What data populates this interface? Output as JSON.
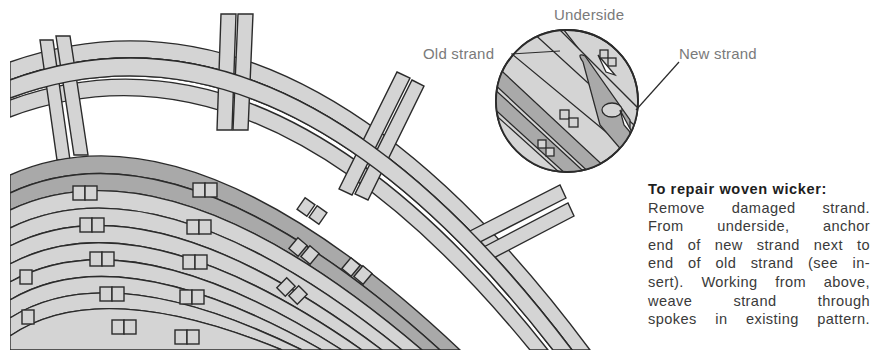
{
  "figure": {
    "inset": {
      "title": "Underside",
      "labels": {
        "old_strand": "Old strand",
        "new_strand": "New strand"
      }
    },
    "caption": {
      "heading": "To repair woven wicker:",
      "lines": [
        "Remove damaged strand.",
        "From underside, anchor",
        "end of new strand next to",
        "end of old strand (see in-",
        "sert). Working from above,",
        "weave strand through",
        "spokes in existing pattern."
      ]
    },
    "colors": {
      "light_strand": "#d4d4d4",
      "dark_strand": "#a9a9a9",
      "outline": "#2b2b2b",
      "label_text": "#7a7a7a"
    }
  }
}
